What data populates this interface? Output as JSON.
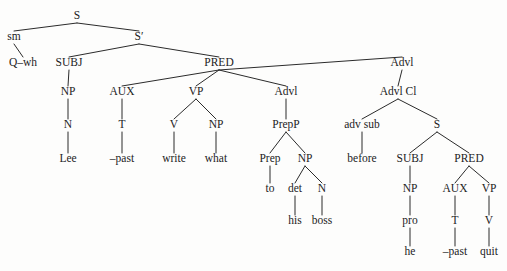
{
  "figure": {
    "sentence": "Q-wh Lee -past write what to his boss before he -past quit",
    "ink_color": "#1c1c1c",
    "line_color": "#2b2b2b",
    "background_color": "#fdfdfc"
  },
  "tree": {
    "nodes": [
      {
        "id": "S",
        "label": "S",
        "kind": "category",
        "x": 77,
        "y": 19
      },
      {
        "id": "sm",
        "label": "sm",
        "kind": "category",
        "x": 14,
        "y": 40
      },
      {
        "id": "Sbar",
        "label": "S′",
        "kind": "category",
        "x": 139,
        "y": 40
      },
      {
        "id": "Qwh",
        "label": "Q–wh",
        "kind": "word",
        "x": 23,
        "y": 66
      },
      {
        "id": "SUBJ1",
        "label": "SUBJ",
        "kind": "category",
        "x": 69,
        "y": 66
      },
      {
        "id": "PRED1",
        "label": "PRED",
        "kind": "category",
        "x": 219,
        "y": 66
      },
      {
        "id": "Advl1",
        "label": "Advl",
        "kind": "category",
        "x": 402,
        "y": 66
      },
      {
        "id": "NP1",
        "label": "NP",
        "kind": "category",
        "x": 68,
        "y": 95
      },
      {
        "id": "AUX1",
        "label": "AUX",
        "kind": "category",
        "x": 122,
        "y": 95
      },
      {
        "id": "VP1",
        "label": "VP",
        "kind": "category",
        "x": 196,
        "y": 95
      },
      {
        "id": "Advl2",
        "label": "Advl",
        "kind": "category",
        "x": 286,
        "y": 95
      },
      {
        "id": "AdvlCl",
        "label": "Advl Cl",
        "kind": "category",
        "x": 398,
        "y": 95
      },
      {
        "id": "N1",
        "label": "N",
        "kind": "category",
        "x": 68,
        "y": 128
      },
      {
        "id": "T1",
        "label": "T",
        "kind": "category",
        "x": 122,
        "y": 128
      },
      {
        "id": "V1",
        "label": "V",
        "kind": "category",
        "x": 174,
        "y": 128
      },
      {
        "id": "NP2",
        "label": "NP",
        "kind": "category",
        "x": 216,
        "y": 128
      },
      {
        "id": "PrepP",
        "label": "PrepP",
        "kind": "category",
        "x": 286,
        "y": 128
      },
      {
        "id": "advsub",
        "label": "adv sub",
        "kind": "category",
        "x": 362,
        "y": 128
      },
      {
        "id": "S2",
        "label": "S",
        "kind": "category",
        "x": 437,
        "y": 128
      },
      {
        "id": "Lee",
        "label": "Lee",
        "kind": "word",
        "x": 68,
        "y": 162
      },
      {
        "id": "past1",
        "label": "–past",
        "kind": "word",
        "x": 122,
        "y": 162
      },
      {
        "id": "write",
        "label": "write",
        "kind": "word",
        "x": 174,
        "y": 162
      },
      {
        "id": "what",
        "label": "what",
        "kind": "word",
        "x": 216,
        "y": 162
      },
      {
        "id": "Prep",
        "label": "Prep",
        "kind": "category",
        "x": 270,
        "y": 162
      },
      {
        "id": "NP3",
        "label": "NP",
        "kind": "category",
        "x": 305,
        "y": 162
      },
      {
        "id": "before",
        "label": "before",
        "kind": "word",
        "x": 362,
        "y": 162
      },
      {
        "id": "SUBJ2",
        "label": "SUBJ",
        "kind": "category",
        "x": 410,
        "y": 162
      },
      {
        "id": "PRED2",
        "label": "PRED",
        "kind": "category",
        "x": 469,
        "y": 162
      },
      {
        "id": "to",
        "label": "to",
        "kind": "word",
        "x": 270,
        "y": 192
      },
      {
        "id": "det",
        "label": "det",
        "kind": "category",
        "x": 295,
        "y": 192
      },
      {
        "id": "N2",
        "label": "N",
        "kind": "category",
        "x": 322,
        "y": 192
      },
      {
        "id": "NP4",
        "label": "NP",
        "kind": "category",
        "x": 410,
        "y": 192
      },
      {
        "id": "AUX2",
        "label": "AUX",
        "kind": "category",
        "x": 455,
        "y": 192
      },
      {
        "id": "VP2",
        "label": "VP",
        "kind": "category",
        "x": 489,
        "y": 192
      },
      {
        "id": "his",
        "label": "his",
        "kind": "word",
        "x": 295,
        "y": 224
      },
      {
        "id": "boss",
        "label": "boss",
        "kind": "word",
        "x": 322,
        "y": 224
      },
      {
        "id": "pro",
        "label": "pro",
        "kind": "word",
        "x": 410,
        "y": 224
      },
      {
        "id": "T2",
        "label": "T",
        "kind": "category",
        "x": 455,
        "y": 224
      },
      {
        "id": "V2",
        "label": "V",
        "kind": "category",
        "x": 489,
        "y": 224
      },
      {
        "id": "he",
        "label": "he",
        "kind": "word",
        "x": 410,
        "y": 255
      },
      {
        "id": "past2",
        "label": "–past",
        "kind": "word",
        "x": 455,
        "y": 255
      },
      {
        "id": "quit",
        "label": "quit",
        "kind": "word",
        "x": 489,
        "y": 255
      }
    ],
    "edges": [
      {
        "from": "S",
        "to": "sm"
      },
      {
        "from": "S",
        "to": "Sbar"
      },
      {
        "from": "sm",
        "to": "Qwh"
      },
      {
        "from": "Sbar",
        "to": "SUBJ1"
      },
      {
        "from": "Sbar",
        "to": "PRED1"
      },
      {
        "from": "SUBJ1",
        "to": "NP1"
      },
      {
        "from": "PRED1",
        "to": "AUX1"
      },
      {
        "from": "PRED1",
        "to": "VP1"
      },
      {
        "from": "PRED1",
        "to": "Advl2"
      },
      {
        "from": "PRED1",
        "to": "Advl1"
      },
      {
        "from": "Advl1",
        "to": "AdvlCl"
      },
      {
        "from": "NP1",
        "to": "N1"
      },
      {
        "from": "AUX1",
        "to": "T1"
      },
      {
        "from": "VP1",
        "to": "V1"
      },
      {
        "from": "VP1",
        "to": "NP2"
      },
      {
        "from": "Advl2",
        "to": "PrepP"
      },
      {
        "from": "AdvlCl",
        "to": "advsub"
      },
      {
        "from": "AdvlCl",
        "to": "S2"
      },
      {
        "from": "N1",
        "to": "Lee"
      },
      {
        "from": "T1",
        "to": "past1"
      },
      {
        "from": "V1",
        "to": "write"
      },
      {
        "from": "NP2",
        "to": "what"
      },
      {
        "from": "PrepP",
        "to": "Prep"
      },
      {
        "from": "PrepP",
        "to": "NP3"
      },
      {
        "from": "advsub",
        "to": "before"
      },
      {
        "from": "S2",
        "to": "SUBJ2"
      },
      {
        "from": "S2",
        "to": "PRED2"
      },
      {
        "from": "Prep",
        "to": "to"
      },
      {
        "from": "NP3",
        "to": "det"
      },
      {
        "from": "NP3",
        "to": "N2"
      },
      {
        "from": "SUBJ2",
        "to": "NP4"
      },
      {
        "from": "PRED2",
        "to": "AUX2"
      },
      {
        "from": "PRED2",
        "to": "VP2"
      },
      {
        "from": "det",
        "to": "his"
      },
      {
        "from": "N2",
        "to": "boss"
      },
      {
        "from": "NP4",
        "to": "pro"
      },
      {
        "from": "AUX2",
        "to": "T2"
      },
      {
        "from": "VP2",
        "to": "V2"
      },
      {
        "from": "pro",
        "to": "he"
      },
      {
        "from": "T2",
        "to": "past2"
      },
      {
        "from": "V2",
        "to": "quit"
      }
    ]
  }
}
